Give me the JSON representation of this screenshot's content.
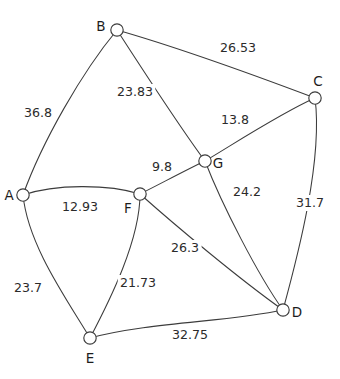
{
  "figure": {
    "type": "weighted-undirected-graph",
    "background_color": "#ffffff",
    "stroke_color": "#3c3c3c",
    "text_color": "#1d1d1d",
    "width": 340,
    "height": 379
  },
  "chart_data": {
    "type": "diagram",
    "title": "",
    "xlabel": "",
    "ylabel": "",
    "nodes": [
      {
        "id": "A",
        "label": "A",
        "x": 23,
        "y": 195,
        "label_x": 9,
        "label_y": 196,
        "anchor": "middle"
      },
      {
        "id": "B",
        "label": "B",
        "x": 117,
        "y": 30,
        "label_x": 101,
        "label_y": 27,
        "anchor": "middle"
      },
      {
        "id": "C",
        "label": "C",
        "x": 315,
        "y": 98,
        "label_x": 318,
        "label_y": 82,
        "anchor": "middle"
      },
      {
        "id": "D",
        "label": "D",
        "x": 283,
        "y": 310,
        "label_x": 297,
        "label_y": 313,
        "anchor": "middle"
      },
      {
        "id": "E",
        "label": "E",
        "x": 90,
        "y": 338,
        "label_x": 90,
        "label_y": 359,
        "anchor": "middle"
      },
      {
        "id": "F",
        "label": "F",
        "x": 140,
        "y": 194,
        "label_x": 128,
        "label_y": 209,
        "anchor": "middle"
      },
      {
        "id": "G",
        "label": "G",
        "x": 205,
        "y": 161,
        "label_x": 218,
        "label_y": 164,
        "anchor": "middle"
      }
    ],
    "edges": [
      {
        "id": "A-B",
        "from": "A",
        "to": "B",
        "weight": "36.8",
        "label_x": 38,
        "label_y": 113,
        "path": "M 23 195 C 42 142 82 72 117 30"
      },
      {
        "id": "B-C",
        "from": "B",
        "to": "C",
        "weight": "26.53",
        "label_x": 238,
        "label_y": 48,
        "path": "M 117 30 C 180 48 262 78 315 98"
      },
      {
        "id": "B-G",
        "from": "B",
        "to": "G",
        "weight": "23.83",
        "label_x": 135,
        "label_y": 92,
        "path": "M 117 30 C 148 78 182 130 205 161"
      },
      {
        "id": "C-G",
        "from": "C",
        "to": "G",
        "weight": "13.8",
        "label_x": 235,
        "label_y": 120,
        "path": "M 315 98 C 283 112 240 140 205 161"
      },
      {
        "id": "C-D",
        "from": "C",
        "to": "D",
        "weight": "31.7",
        "label_x": 310,
        "label_y": 203,
        "path": "M 315 98 C 323 160 298 255 283 310"
      },
      {
        "id": "A-F",
        "from": "A",
        "to": "F",
        "weight": "12.93",
        "label_x": 80,
        "label_y": 207,
        "path": "M 23 195 C 55 184 108 184 140 194"
      },
      {
        "id": "F-G",
        "from": "F",
        "to": "G",
        "weight": "9.8",
        "label_x": 162,
        "label_y": 167,
        "path": "M 140 194 C 160 184 186 170 205 161"
      },
      {
        "id": "G-D",
        "from": "G",
        "to": "D",
        "weight": "24.2",
        "label_x": 247,
        "label_y": 192,
        "path": "M 205 161 C 222 205 258 275 283 310"
      },
      {
        "id": "F-D",
        "from": "F",
        "to": "D",
        "weight": "26.3",
        "label_x": 185,
        "label_y": 248,
        "path": "M 140 194 C 176 226 238 278 283 310"
      },
      {
        "id": "A-E",
        "from": "A",
        "to": "E",
        "weight": "23.7",
        "label_x": 28,
        "label_y": 288,
        "path": "M 23 195 C 28 245 66 298 90 338"
      },
      {
        "id": "F-E",
        "from": "F",
        "to": "E",
        "weight": "21.73",
        "label_x": 138,
        "label_y": 283,
        "path": "M 140 194 C 140 240 110 300 90 338"
      },
      {
        "id": "E-D",
        "from": "E",
        "to": "D",
        "weight": "32.75",
        "label_x": 190,
        "label_y": 335,
        "path": "M 90 338 C 150 322 228 322 283 310"
      }
    ],
    "node_radius": 6.2
  }
}
